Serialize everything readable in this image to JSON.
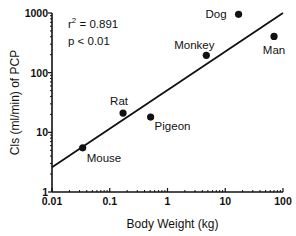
{
  "chart_data": {
    "type": "scatter",
    "title": "",
    "xlabel": "Body Weight (kg)",
    "ylabel": "Cls (ml/min) of PCP",
    "xscale": "log",
    "yscale": "log",
    "xlim": [
      0.01,
      100
    ],
    "ylim": [
      1,
      1000
    ],
    "xticks": [
      "0.01",
      "0.1",
      "1",
      "10",
      "100"
    ],
    "yticks": [
      "1",
      "10",
      "100",
      "1000"
    ],
    "grid": false,
    "legend": null,
    "annotations": [
      "r² = 0.891",
      "p < 0.01"
    ],
    "points": [
      {
        "label": "Mouse",
        "x": 0.034,
        "y": 5.5
      },
      {
        "label": "Rat",
        "x": 0.17,
        "y": 21
      },
      {
        "label": "Pigeon",
        "x": 0.51,
        "y": 18
      },
      {
        "label": "Monkey",
        "x": 4.7,
        "y": 195
      },
      {
        "label": "Dog",
        "x": 17,
        "y": 950
      },
      {
        "label": "Man",
        "x": 70,
        "y": 405
      }
    ],
    "regression_line": {
      "x": [
        0.01,
        100
      ],
      "y": [
        2.6,
        1000
      ]
    }
  },
  "stats": {
    "r2_prefix": "r",
    "r2_sup": "2",
    "r2_value": " = 0.891",
    "p": "p < 0.01"
  }
}
